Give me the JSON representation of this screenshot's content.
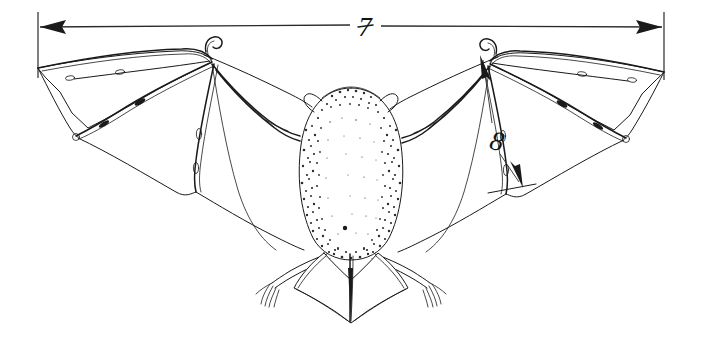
{
  "figure": {
    "kind": "scientific-line-drawing",
    "view": "dorsal, wings fully spread",
    "background_color": "#ffffff",
    "ink_color": "#1a1a1a",
    "width_px": 703,
    "height_px": 343
  },
  "annotations": {
    "wingspan": {
      "label": "7",
      "name": "wingspan-dimension",
      "orientation": "horizontal",
      "arrow_style": "double-headed",
      "x_start_px": 38,
      "x_end_px": 664,
      "y_px": 27,
      "label_x_px": 365,
      "label_y_px": 27
    },
    "forearm": {
      "label": "8",
      "name": "forearm-dimension",
      "orientation": "diagonal",
      "arrow_style": "double-headed",
      "x_start_px": 482,
      "y_start_px": 58,
      "x_end_px": 521,
      "y_end_px": 185,
      "label_x_px": 495,
      "label_y_px": 140
    }
  },
  "anatomy": {
    "parts": [
      "head",
      "ears",
      "body",
      "forearm",
      "thumb-claw",
      "wing-membrane",
      "digits",
      "hind-legs",
      "feet-claws",
      "uropatagium",
      "tail"
    ]
  }
}
